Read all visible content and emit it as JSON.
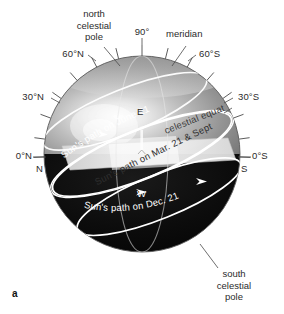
{
  "figure": {
    "letter": "a",
    "caption_labels": {
      "north_celestial_pole": [
        "north",
        "celestial",
        "pole"
      ],
      "south_celestial_pole": [
        "south",
        "celestial",
        "pole"
      ],
      "meridian": "meridian"
    }
  },
  "declination_ticks": {
    "zenith": "90°",
    "left": [
      "60°N",
      "30°N",
      "0°N"
    ],
    "right": [
      "60°S",
      "30°S",
      "0°S"
    ]
  },
  "cardinal_points": {
    "north": "N",
    "south": "S",
    "east": "E",
    "west": "W"
  },
  "great_circles": {
    "celestial_equator": "celestial equator",
    "meridian": "meridian"
  },
  "sun_paths": [
    {
      "id": "june",
      "label": "Sun's path on June 21"
    },
    {
      "id": "equinox",
      "label": "Sun's path on Mar. 21 & Sept. 21"
    },
    {
      "id": "december",
      "label": "Sun's path on Dec. 21"
    }
  ],
  "colors": {
    "background": "#ffffff",
    "sphere_upper_light": "#f2f2f2",
    "sphere_upper_mid": "#9a9a9a",
    "sphere_upper_dark": "#6e6e6e",
    "sphere_lower": "#0d0d0d",
    "horizon_plane": "#efefef",
    "path_line": "#ffffff",
    "text": "#2b2b2b",
    "leader_line": "#4a4a4a"
  }
}
